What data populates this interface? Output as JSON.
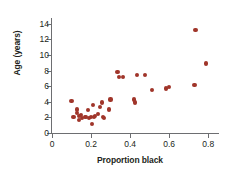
{
  "chart_data": {
    "type": "scatter",
    "title": "",
    "xlabel": "Proportion black",
    "ylabel": "Age (years)",
    "xlim": [
      0,
      0.85
    ],
    "ylim": [
      0,
      14.6
    ],
    "xticks": [
      0,
      0.2,
      0.4,
      0.6,
      0.8
    ],
    "xtick_labels": [
      "0",
      "0.2",
      "0.4",
      "0.6",
      "0.8"
    ],
    "yticks": [
      0,
      2,
      4,
      6,
      8,
      10,
      12,
      14
    ],
    "ytick_labels": [
      "0",
      "2",
      "4",
      "6",
      "8",
      "10",
      "12",
      "14"
    ],
    "grid": false,
    "legend": null,
    "marker_color": "#a0352a",
    "axis_color": "#6d6e71",
    "points": [
      {
        "x": 0.1,
        "y": 4.1
      },
      {
        "x": 0.11,
        "y": 2.1
      },
      {
        "x": 0.13,
        "y": 3.0
      },
      {
        "x": 0.13,
        "y": 2.6
      },
      {
        "x": 0.14,
        "y": 2.2
      },
      {
        "x": 0.14,
        "y": 1.7
      },
      {
        "x": 0.15,
        "y": 2.3
      },
      {
        "x": 0.155,
        "y": 1.9
      },
      {
        "x": 0.17,
        "y": 2.0
      },
      {
        "x": 0.175,
        "y": 2.1
      },
      {
        "x": 0.185,
        "y": 2.9
      },
      {
        "x": 0.19,
        "y": 1.9
      },
      {
        "x": 0.2,
        "y": 2.0
      },
      {
        "x": 0.205,
        "y": 1.2
      },
      {
        "x": 0.21,
        "y": 3.6
      },
      {
        "x": 0.215,
        "y": 2.1
      },
      {
        "x": 0.22,
        "y": 2.2
      },
      {
        "x": 0.235,
        "y": 2.4
      },
      {
        "x": 0.245,
        "y": 3.3
      },
      {
        "x": 0.255,
        "y": 3.9
      },
      {
        "x": 0.26,
        "y": 2.0
      },
      {
        "x": 0.265,
        "y": 1.9
      },
      {
        "x": 0.29,
        "y": 3.0
      },
      {
        "x": 0.3,
        "y": 4.3
      },
      {
        "x": 0.335,
        "y": 7.8
      },
      {
        "x": 0.345,
        "y": 7.2
      },
      {
        "x": 0.365,
        "y": 7.2
      },
      {
        "x": 0.42,
        "y": 4.3
      },
      {
        "x": 0.425,
        "y": 3.9
      },
      {
        "x": 0.435,
        "y": 7.4
      },
      {
        "x": 0.475,
        "y": 7.4
      },
      {
        "x": 0.51,
        "y": 5.5
      },
      {
        "x": 0.585,
        "y": 5.7
      },
      {
        "x": 0.6,
        "y": 5.9
      },
      {
        "x": 0.73,
        "y": 6.1
      },
      {
        "x": 0.735,
        "y": 13.2
      },
      {
        "x": 0.79,
        "y": 8.9
      }
    ]
  }
}
